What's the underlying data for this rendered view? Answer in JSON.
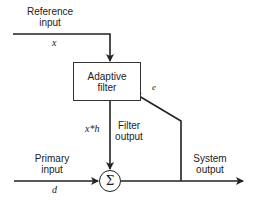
{
  "diagram": {
    "title": "",
    "blocks": {
      "adaptive_filter": {
        "line1": "Adaptive",
        "line2": "filter"
      },
      "summer": {
        "symbol": "Σ"
      }
    },
    "labels": {
      "reference_input": {
        "line1": "Reference",
        "line2": "input"
      },
      "reference_var": "x",
      "filter_output": {
        "line1": "Filter",
        "line2": "output"
      },
      "filter_output_var": "x*h",
      "primary_input": {
        "line1": "Primary",
        "line2": "input"
      },
      "primary_var": "d",
      "system_output": {
        "line1": "System",
        "line2": "output"
      },
      "error_var": "e"
    },
    "edges": [
      {
        "from": "reference_input",
        "to": "adaptive_filter",
        "label": "x"
      },
      {
        "from": "adaptive_filter",
        "to": "summer",
        "label": "x*h"
      },
      {
        "from": "primary_input",
        "to": "summer",
        "label": "d"
      },
      {
        "from": "summer",
        "to": "system_output"
      },
      {
        "from": "system_output",
        "to": "adaptive_filter",
        "label": "e"
      }
    ],
    "colors": {
      "stroke": "#222222",
      "background": "#ffffff"
    }
  }
}
